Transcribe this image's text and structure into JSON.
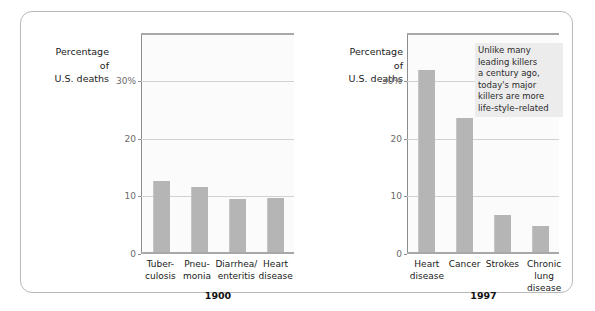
{
  "figure": {
    "axis_caption_lines": [
      "Percentage",
      "of",
      "U.S. deaths"
    ],
    "annotation": "Unlike many\nleading killers\na century ago,\ntoday's major\nkillers are more\nlife-style–related",
    "colors": {
      "bar": "#b5b5b5",
      "gridline": "#d2d2d2",
      "axis": "#8d8d8d",
      "plot_background": "#fbfbfb",
      "annotation_background": "#ececec",
      "frame_border": "#b9b9b9",
      "tick_label": "#6b6b6b",
      "text": "#1a1a1a"
    }
  },
  "chart_data": [
    {
      "type": "bar",
      "title": "1900",
      "xlabel": "",
      "ylabel": "Percentage of U.S. deaths",
      "ylim": [
        0,
        38
      ],
      "yticks": [
        0,
        10,
        20,
        30
      ],
      "ytick_labels": [
        "0",
        "10",
        "20",
        "30%"
      ],
      "grid": true,
      "legend": "none",
      "categories": [
        "Tuber-\nculosis",
        "Pneu-\nmonia",
        "Diarrhea/\nenteritis",
        "Heart\ndisease"
      ],
      "values": [
        12.4,
        11.2,
        9.2,
        9.3
      ]
    },
    {
      "type": "bar",
      "title": "1997",
      "xlabel": "",
      "ylabel": "Percentage of U.S. deaths",
      "ylim": [
        0,
        38
      ],
      "yticks": [
        0,
        10,
        20,
        30
      ],
      "ytick_labels": [
        "0",
        "10",
        "20",
        "30%"
      ],
      "grid": true,
      "legend": "none",
      "annotation": "Unlike many\nleading killers\na century ago,\ntoday's major\nkillers are more\nlife-style–related",
      "categories": [
        "Heart\ndisease",
        "Cancer",
        "Strokes",
        "Chronic\nlung disease"
      ],
      "values": [
        31.6,
        23.2,
        6.5,
        4.6
      ]
    }
  ]
}
